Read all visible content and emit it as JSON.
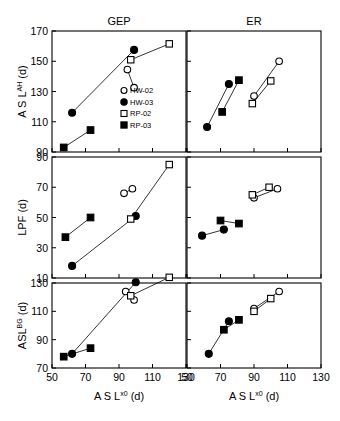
{
  "figure": {
    "column_titles": [
      "GEP",
      "ER"
    ],
    "x_axis_label": "A S L",
    "x_axis_sup": "x0",
    "x_axis_unit": "(d)",
    "row_axis_labels": [
      {
        "main": "A S L",
        "sup": "AH",
        "unit": "(d)"
      },
      {
        "main": "LPF",
        "sup": "",
        "unit": "(d)"
      },
      {
        "main": "ASL",
        "sup": "BG",
        "unit": "(d)"
      }
    ],
    "legend": {
      "position": "top-left-panel-bottom-right",
      "entries": [
        {
          "label": "HW-02",
          "marker": "open-circle"
        },
        {
          "label": "HW-03",
          "marker": "filled-circle"
        },
        {
          "label": "RP-02",
          "marker": "open-square"
        },
        {
          "label": "RP-03",
          "marker": "filled-square"
        }
      ]
    }
  },
  "chart_data": {
    "type": "scatter",
    "title": "",
    "xlabel": "ASL^x0 (d)",
    "grid": false,
    "panels": [
      {
        "id": "gep-aslah",
        "column": "GEP",
        "row": "ASL^AH (d)",
        "ylabel": "ASL^AH (d)",
        "xlim": [
          50,
          130
        ],
        "ylim": [
          90,
          170
        ],
        "xticks": [
          50,
          70,
          90,
          110,
          130
        ],
        "yticks": [
          90,
          110,
          130,
          150,
          170
        ],
        "series": [
          {
            "name": "HW-02",
            "marker": "open-circle",
            "connected": true,
            "points": [
              [
                95,
                144.5
              ],
              [
                99,
                132.5
              ]
            ]
          },
          {
            "name": "HW-03",
            "marker": "filled-circle",
            "connected": true,
            "points": [
              [
                62,
                116
              ],
              [
                99,
                157.5
              ]
            ]
          },
          {
            "name": "RP-02",
            "marker": "open-square",
            "connected": true,
            "points": [
              [
                97,
                151
              ],
              [
                120,
                161.5
              ]
            ]
          },
          {
            "name": "RP-03",
            "marker": "filled-square",
            "connected": true,
            "points": [
              [
                57,
                93
              ],
              [
                73,
                104.5
              ]
            ]
          }
        ]
      },
      {
        "id": "er-aslah",
        "column": "ER",
        "row": "ASL^AH (d)",
        "ylabel": "ASL^AH (d)",
        "xlim": [
          50,
          130
        ],
        "ylim": [
          90,
          170
        ],
        "xticks": [
          50,
          70,
          90,
          110,
          130
        ],
        "yticks": [
          90,
          110,
          130,
          150,
          170
        ],
        "series": [
          {
            "name": "HW-02",
            "marker": "open-circle",
            "connected": true,
            "points": [
              [
                90,
                127
              ],
              [
                105,
                150
              ]
            ]
          },
          {
            "name": "HW-03",
            "marker": "filled-circle",
            "connected": true,
            "points": [
              [
                62,
                106.5
              ],
              [
                75,
                135
              ]
            ]
          },
          {
            "name": "RP-02",
            "marker": "open-square",
            "connected": true,
            "points": [
              [
                89,
                122
              ],
              [
                100,
                137
              ]
            ]
          },
          {
            "name": "RP-03",
            "marker": "filled-square",
            "connected": true,
            "points": [
              [
                71,
                116.5
              ],
              [
                81,
                137.5
              ]
            ]
          }
        ]
      },
      {
        "id": "gep-lpf",
        "column": "GEP",
        "row": "LPF (d)",
        "ylabel": "LPF (d)",
        "xlim": [
          50,
          130
        ],
        "ylim": [
          10,
          90
        ],
        "xticks": [
          50,
          70,
          90,
          110,
          130
        ],
        "yticks": [
          10,
          30,
          50,
          70,
          90
        ],
        "series": [
          {
            "name": "HW-02",
            "marker": "open-circle",
            "connected": true,
            "points": [
              [
                93,
                66
              ],
              [
                98,
                69
              ]
            ]
          },
          {
            "name": "HW-03",
            "marker": "filled-circle",
            "connected": true,
            "points": [
              [
                62,
                18
              ],
              [
                100,
                51
              ]
            ]
          },
          {
            "name": "RP-02",
            "marker": "open-square",
            "connected": true,
            "points": [
              [
                97,
                49
              ],
              [
                120,
                85
              ]
            ]
          },
          {
            "name": "RP-03",
            "marker": "filled-square",
            "connected": true,
            "points": [
              [
                58,
                37
              ],
              [
                73,
                50
              ]
            ]
          }
        ]
      },
      {
        "id": "er-lpf",
        "column": "ER",
        "row": "LPF (d)",
        "ylabel": "LPF (d)",
        "xlim": [
          50,
          130
        ],
        "ylim": [
          10,
          90
        ],
        "xticks": [
          50,
          70,
          90,
          110,
          130
        ],
        "yticks": [
          10,
          30,
          50,
          70,
          90
        ],
        "series": [
          {
            "name": "HW-02",
            "marker": "open-circle",
            "connected": true,
            "points": [
              [
                90,
                63
              ],
              [
                104,
                69
              ]
            ]
          },
          {
            "name": "HW-03",
            "marker": "filled-circle",
            "connected": true,
            "points": [
              [
                59,
                38
              ],
              [
                72,
                42
              ]
            ]
          },
          {
            "name": "RP-02",
            "marker": "open-square",
            "connected": true,
            "points": [
              [
                89,
                65
              ],
              [
                99,
                70
              ]
            ]
          },
          {
            "name": "RP-03",
            "marker": "filled-square",
            "connected": true,
            "points": [
              [
                70,
                48
              ],
              [
                81,
                46
              ]
            ]
          }
        ]
      },
      {
        "id": "gep-aslbg",
        "column": "GEP",
        "row": "ASL^BG (d)",
        "ylabel": "ASL^BG (d)",
        "xlim": [
          50,
          130
        ],
        "ylim": [
          70,
          130
        ],
        "xticks": [
          50,
          70,
          90,
          110,
          130
        ],
        "yticks": [
          70,
          90,
          110,
          130
        ],
        "series": [
          {
            "name": "HW-02",
            "marker": "open-circle",
            "connected": true,
            "points": [
              [
                94,
                124
              ],
              [
                99,
                118
              ]
            ]
          },
          {
            "name": "HW-03",
            "marker": "filled-circle",
            "connected": true,
            "points": [
              [
                62,
                80
              ],
              [
                100,
                130.5
              ]
            ]
          },
          {
            "name": "RP-02",
            "marker": "open-square",
            "connected": true,
            "points": [
              [
                97,
                121
              ],
              [
                120,
                134
              ]
            ]
          },
          {
            "name": "RP-03",
            "marker": "filled-square",
            "connected": true,
            "points": [
              [
                57,
                78
              ],
              [
                73,
                84
              ]
            ]
          }
        ]
      },
      {
        "id": "er-aslbg",
        "column": "ER",
        "row": "ASL^BG (d)",
        "ylabel": "ASL^BG (d)",
        "xlim": [
          50,
          130
        ],
        "ylim": [
          70,
          130
        ],
        "xticks": [
          50,
          70,
          90,
          110,
          130
        ],
        "yticks": [
          70,
          90,
          110,
          130
        ],
        "series": [
          {
            "name": "HW-02",
            "marker": "open-circle",
            "connected": true,
            "points": [
              [
                90,
                112
              ],
              [
                105,
                124
              ]
            ]
          },
          {
            "name": "HW-03",
            "marker": "filled-circle",
            "connected": true,
            "points": [
              [
                63,
                80
              ],
              [
                75,
                103
              ]
            ]
          },
          {
            "name": "RP-02",
            "marker": "open-square",
            "connected": true,
            "points": [
              [
                90,
                110
              ],
              [
                100,
                119
              ]
            ]
          },
          {
            "name": "RP-03",
            "marker": "filled-square",
            "connected": true,
            "points": [
              [
                72,
                97
              ],
              [
                81,
                104
              ]
            ]
          }
        ]
      }
    ]
  }
}
